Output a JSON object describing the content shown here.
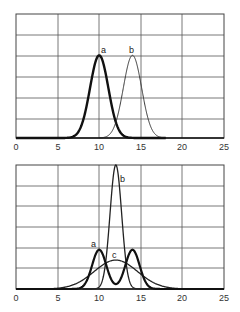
{
  "chart_data": [
    {
      "type": "line",
      "title": "",
      "xlabel": "",
      "ylabel": "",
      "xlim": [
        0,
        25
      ],
      "ylim": [
        0,
        6
      ],
      "x_ticks": [
        "0",
        "5",
        "10",
        "15",
        "20",
        "25"
      ],
      "grid": true,
      "series": [
        {
          "name": "a",
          "label": "a",
          "shape": "gaussian",
          "center": 10,
          "height": 4,
          "sigma": 1.1,
          "weight": "bold"
        },
        {
          "name": "b",
          "label": "b",
          "shape": "gaussian",
          "center": 14,
          "height": 4,
          "sigma": 1.1,
          "weight": "thin"
        }
      ]
    },
    {
      "type": "line",
      "title": "",
      "xlabel": "",
      "ylabel": "",
      "xlim": [
        0,
        25
      ],
      "ylim": [
        0,
        6
      ],
      "x_ticks": [
        "0",
        "5",
        "10",
        "15",
        "20",
        "25"
      ],
      "grid": true,
      "series": [
        {
          "name": "a",
          "label": "a",
          "shape": "bimodal",
          "centers": [
            10,
            14
          ],
          "height": 1.9,
          "sigma": 0.85,
          "dip_at_12": 0.5,
          "weight": "bold"
        },
        {
          "name": "b",
          "label": "b",
          "shape": "gaussian",
          "center": 12,
          "height": 6,
          "sigma": 0.7,
          "weight": "medium"
        },
        {
          "name": "c",
          "label": "c",
          "shape": "gaussian",
          "center": 12,
          "height": 1.4,
          "sigma": 2.6,
          "weight": "medium"
        }
      ]
    }
  ],
  "top_chart": {
    "label_a": "a",
    "label_b": "b",
    "ticks": [
      "0",
      "5",
      "10",
      "15",
      "20",
      "25"
    ]
  },
  "bottom_chart": {
    "label_a": "a",
    "label_b": "b",
    "label_c": "c",
    "ticks": [
      "0",
      "5",
      "10",
      "15",
      "20",
      "25"
    ]
  }
}
